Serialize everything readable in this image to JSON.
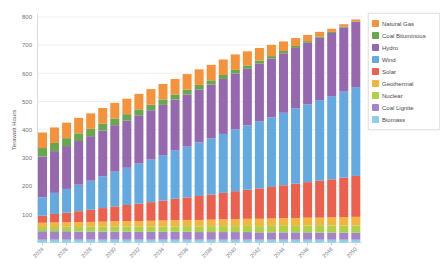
{
  "chart_data": {
    "type": "bar",
    "stacked": true,
    "title": "",
    "xlabel": "",
    "ylabel": "Terawatt Hours",
    "ylim": [
      0,
      800
    ],
    "yticks": [
      100,
      200,
      300,
      400,
      500,
      600,
      700,
      800
    ],
    "grid": true,
    "legend_position": "right",
    "categories": [
      "2024",
      "2025",
      "2026",
      "2027",
      "2028",
      "2029",
      "2030",
      "2031",
      "2032",
      "2033",
      "2034",
      "2035",
      "2036",
      "2037",
      "2038",
      "2039",
      "2040",
      "2041",
      "2042",
      "2043",
      "2044",
      "2045",
      "2046",
      "2047",
      "2048",
      "2049",
      "2050"
    ],
    "xtick_labels": [
      "2024",
      "2026",
      "2028",
      "2030",
      "2032",
      "2034",
      "2036",
      "2038",
      "2040",
      "2042",
      "2044",
      "2046",
      "2048",
      "2050"
    ],
    "series": [
      {
        "name": "Natural Gas",
        "color": "#F5923C",
        "values": [
          55,
          55,
          55,
          55,
          55,
          55,
          55,
          55,
          55,
          55,
          55,
          55,
          55,
          55,
          55,
          55,
          55,
          50,
          45,
          40,
          34,
          28,
          22,
          16,
          11,
          8,
          7
        ]
      },
      {
        "name": "Coal Bituminous",
        "color": "#69A74F",
        "values": [
          30,
          29,
          28,
          27,
          26,
          25,
          24,
          22,
          21,
          20,
          19,
          18,
          17,
          16,
          15,
          14,
          13,
          12,
          11,
          9,
          8,
          7,
          6,
          5,
          4,
          3,
          2
        ]
      },
      {
        "name": "Hydro",
        "color": "#9669AE",
        "values": [
          145,
          148,
          152,
          155,
          158,
          162,
          165,
          168,
          171,
          175,
          178,
          181,
          185,
          188,
          191,
          195,
          198,
          201,
          204,
          208,
          211,
          214,
          218,
          221,
          224,
          228,
          231
        ]
      },
      {
        "name": "Wind",
        "color": "#64A9E0",
        "values": [
          65,
          75,
          84,
          94,
          103,
          113,
          123,
          132,
          142,
          151,
          161,
          171,
          180,
          190,
          199,
          209,
          219,
          228,
          238,
          247,
          257,
          267,
          276,
          286,
          295,
          305,
          315
        ]
      },
      {
        "name": "Solar",
        "color": "#EC604E",
        "values": [
          25,
          30,
          34,
          39,
          43,
          48,
          53,
          57,
          62,
          66,
          71,
          76,
          80,
          85,
          89,
          94,
          99,
          103,
          108,
          112,
          117,
          122,
          126,
          131,
          135,
          140,
          145
        ]
      },
      {
        "name": "Geothermal",
        "color": "#F2B53D",
        "values": [
          15,
          16,
          16,
          17,
          17,
          18,
          19,
          19,
          20,
          20,
          21,
          22,
          22,
          23,
          23,
          24,
          25,
          25,
          26,
          26,
          27,
          28,
          28,
          29,
          29,
          30,
          31
        ]
      },
      {
        "name": "Nuclear",
        "color": "#ACD145",
        "values": [
          15,
          15,
          16,
          16,
          17,
          17,
          17,
          18,
          18,
          19,
          19,
          19,
          20,
          20,
          21,
          21,
          21,
          22,
          22,
          23,
          23,
          23,
          24,
          24,
          25,
          25,
          25
        ]
      },
      {
        "name": "Coal Lignite",
        "color": "#A484C8",
        "values": [
          30,
          30,
          30,
          29,
          29,
          29,
          29,
          29,
          28,
          28,
          28,
          28,
          28,
          27,
          27,
          27,
          27,
          27,
          26,
          26,
          26,
          26,
          26,
          25,
          25,
          25,
          25
        ]
      },
      {
        "name": "Biomass",
        "color": "#8CCFEA",
        "values": [
          10,
          10,
          10,
          10,
          10,
          10,
          10,
          10,
          10,
          10,
          10,
          10,
          10,
          10,
          10,
          10,
          10,
          10,
          10,
          10,
          10,
          10,
          10,
          10,
          10,
          10,
          10
        ]
      }
    ]
  }
}
